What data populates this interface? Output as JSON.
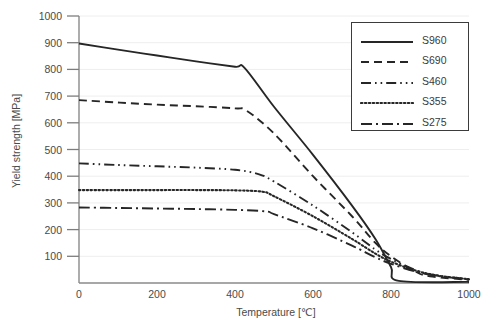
{
  "chart_data": {
    "type": "line",
    "title": "",
    "xlabel": "Temperature [℃]",
    "ylabel": "Yield strength [MPa]",
    "xlim": [
      0,
      1000
    ],
    "ylim": [
      0,
      1000
    ],
    "xticks": [
      0,
      200,
      400,
      600,
      800,
      1000
    ],
    "yticks": [
      0,
      100,
      200,
      300,
      400,
      500,
      600,
      700,
      800,
      900,
      1000
    ],
    "grid": "horizontal-major-light",
    "legend_position": "top-right",
    "line_color": "#262626",
    "series": [
      {
        "name": "S960",
        "dash": "solid",
        "x": [
          0,
          100,
          200,
          300,
          400,
          425,
          500,
          600,
          700,
          760,
          800,
          820,
          1000
        ],
        "y": [
          897,
          874,
          852,
          830,
          810,
          805,
          660,
          480,
          290,
          165,
          60,
          8,
          4
        ]
      },
      {
        "name": "S690",
        "dash": "dashed",
        "x": [
          0,
          100,
          200,
          300,
          400,
          430,
          500,
          600,
          700,
          760,
          800,
          860,
          900,
          1000
        ],
        "y": [
          685,
          676,
          668,
          662,
          654,
          645,
          560,
          400,
          250,
          150,
          100,
          45,
          25,
          12
        ]
      },
      {
        "name": "S460",
        "dash": "dash-dot-dot",
        "x": [
          0,
          100,
          200,
          300,
          400,
          460,
          500,
          600,
          700,
          760,
          800,
          860,
          900,
          1000
        ],
        "y": [
          448,
          442,
          437,
          432,
          424,
          408,
          380,
          290,
          190,
          125,
          90,
          50,
          32,
          14
        ]
      },
      {
        "name": "S355",
        "dash": "dotted",
        "x": [
          0,
          100,
          200,
          300,
          400,
          470,
          500,
          600,
          700,
          760,
          800,
          860,
          920,
          1000
        ],
        "y": [
          348,
          348,
          348,
          348,
          347,
          342,
          325,
          250,
          165,
          110,
          80,
          48,
          28,
          14
        ]
      },
      {
        "name": "S275",
        "dash": "dash-dot",
        "x": [
          0,
          100,
          200,
          300,
          400,
          480,
          500,
          600,
          700,
          760,
          800,
          860,
          920,
          1000
        ],
        "y": [
          283,
          281,
          279,
          277,
          274,
          268,
          258,
          205,
          140,
          96,
          72,
          44,
          26,
          13
        ]
      }
    ]
  },
  "axes": {
    "y_title": "Yield strength [MPa]",
    "x_title": "Temperature [℃]",
    "y_tick_labels": [
      "1000",
      "900",
      "800",
      "700",
      "600",
      "500",
      "400",
      "300",
      "200",
      "100",
      ""
    ],
    "x_tick_labels": [
      "0",
      "200",
      "400",
      "600",
      "800",
      "1000"
    ]
  },
  "legend": {
    "items": [
      {
        "label": "S960",
        "style": "solid-line-icon"
      },
      {
        "label": "S690",
        "style": "dashed-line-icon"
      },
      {
        "label": "S460",
        "style": "dash-dot-dot-line-icon"
      },
      {
        "label": "S355",
        "style": "dotted-line-icon"
      },
      {
        "label": "S275",
        "style": "dash-dot-line-icon"
      }
    ]
  }
}
